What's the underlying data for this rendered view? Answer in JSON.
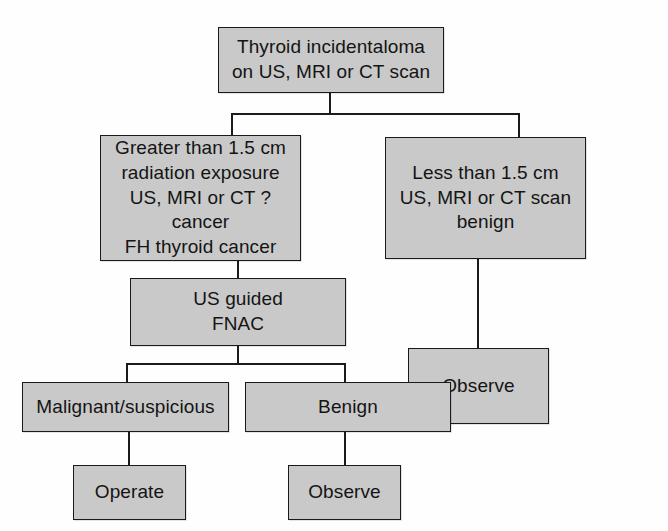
{
  "diagram": {
    "kind": "clinical-management-flowchart",
    "topic": "Thyroid incidentaloma",
    "colors": {
      "node_fill": "#c9c9c9",
      "node_border": "#1a1a1a",
      "edge": "#1b1b1b",
      "text": "#141414",
      "background": "#fefefe"
    },
    "nodes": [
      {
        "id": "root",
        "label": "Thyroid incidentaloma\non US, MRI or CT scan",
        "lines": [
          "Thyroid incidentaloma",
          "on US, MRI or CT scan"
        ]
      },
      {
        "id": "greater",
        "label": "Greater than 1.5 cm\nradiation exposure\nUS, MRI or CT ?cancer\nFH thyroid cancer",
        "lines": [
          "Greater than 1.5 cm",
          "radiation exposure",
          "US, MRI or CT ?cancer",
          "FH thyroid cancer"
        ]
      },
      {
        "id": "less",
        "label": "Less than 1.5 cm\nUS, MRI or CT scan benign",
        "lines": [
          "Less than 1.5 cm",
          "US, MRI or CT scan benign"
        ]
      },
      {
        "id": "fnac",
        "label": "US guided\nFNAC",
        "lines": [
          "US guided",
          "FNAC"
        ]
      },
      {
        "id": "observe_right",
        "label": "Observe",
        "lines": [
          "Observe"
        ]
      },
      {
        "id": "malignant",
        "label": "Malignant/suspicious",
        "lines": [
          "Malignant/suspicious"
        ]
      },
      {
        "id": "benign",
        "label": "Benign",
        "lines": [
          "Benign"
        ]
      },
      {
        "id": "operate",
        "label": "Operate",
        "lines": [
          "Operate"
        ]
      },
      {
        "id": "observe_bottom",
        "label": "Observe",
        "lines": [
          "Observe"
        ]
      }
    ],
    "edges": [
      {
        "from": "root",
        "to": "greater"
      },
      {
        "from": "root",
        "to": "less"
      },
      {
        "from": "greater",
        "to": "fnac"
      },
      {
        "from": "less",
        "to": "observe_right"
      },
      {
        "from": "fnac",
        "to": "malignant"
      },
      {
        "from": "fnac",
        "to": "benign"
      },
      {
        "from": "malignant",
        "to": "operate"
      },
      {
        "from": "benign",
        "to": "observe_bottom"
      }
    ]
  }
}
